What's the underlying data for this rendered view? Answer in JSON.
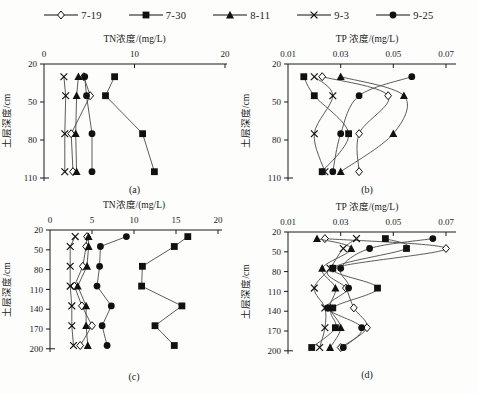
{
  "colors": {
    "axis": "#1a1a1a",
    "line": "#4a4a4a",
    "marker": "#111111",
    "background": "#fdfdfc"
  },
  "legend": {
    "items": [
      {
        "label": "7-19",
        "marker": "open-diamond"
      },
      {
        "label": "7-30",
        "marker": "filled-square"
      },
      {
        "label": "8-11",
        "marker": "filled-triangle"
      },
      {
        "label": "9-3",
        "marker": "cross"
      },
      {
        "label": "9-25",
        "marker": "filled-circle"
      }
    ]
  },
  "chart_data": [
    {
      "id": "a",
      "type": "line",
      "caption": "(a)",
      "title": "TN浓度/(mg/L)",
      "ylabel": "土层深度/cm",
      "xlim": [
        0,
        20
      ],
      "x_ticks": [
        0,
        10,
        20
      ],
      "x_tick_labels": [
        "0",
        "10",
        "20"
      ],
      "ylim": [
        20,
        110
      ],
      "y_ticks": [
        20,
        50,
        80,
        110
      ],
      "smooth": false,
      "depths": [
        30,
        45,
        75,
        105
      ],
      "series": [
        {
          "name": "7-19",
          "marker": "open-diamond",
          "values": [
            4.4,
            5.1,
            3.0,
            3.2
          ]
        },
        {
          "name": "7-30",
          "marker": "filled-square",
          "values": [
            7.8,
            6.8,
            10.9,
            12.2
          ]
        },
        {
          "name": "8-11",
          "marker": "filled-triangle",
          "values": [
            3.8,
            3.6,
            3.5,
            3.6
          ]
        },
        {
          "name": "9-3",
          "marker": "cross",
          "values": [
            2.2,
            2.4,
            2.3,
            2.3
          ]
        },
        {
          "name": "9-25",
          "marker": "filled-circle",
          "values": [
            4.5,
            4.7,
            5.3,
            5.3
          ]
        }
      ]
    },
    {
      "id": "b",
      "type": "line",
      "caption": "(b)",
      "title": "TP 浓度/(mg/L)",
      "ylabel": "土层深度/cm",
      "xlim": [
        0.01,
        0.07
      ],
      "x_ticks": [
        0.01,
        0.03,
        0.05,
        0.07
      ],
      "x_tick_labels": [
        "0.01",
        "0.03",
        "0.05",
        "0.07"
      ],
      "ylim": [
        20,
        110
      ],
      "y_ticks": [
        20,
        50,
        80,
        110
      ],
      "smooth": true,
      "depths": [
        30,
        45,
        75,
        105
      ],
      "series": [
        {
          "name": "7-19",
          "marker": "open-diamond",
          "values": [
            0.023,
            0.048,
            0.037,
            0.037
          ]
        },
        {
          "name": "7-30",
          "marker": "filled-square",
          "values": [
            0.016,
            0.02,
            0.033,
            0.023
          ]
        },
        {
          "name": "8-11",
          "marker": "filled-triangle",
          "values": [
            0.03,
            0.054,
            0.05,
            0.03
          ]
        },
        {
          "name": "9-3",
          "marker": "cross",
          "values": [
            0.02,
            0.027,
            0.02,
            0.024
          ]
        },
        {
          "name": "9-25",
          "marker": "filled-circle",
          "values": [
            0.057,
            0.037,
            0.03,
            0.027
          ]
        }
      ]
    },
    {
      "id": "c",
      "type": "line",
      "caption": "(c)",
      "title": "TN浓度/(mg/L)",
      "ylabel": "土层深度/cm",
      "xlim": [
        0,
        20
      ],
      "x_ticks": [
        0,
        5,
        10,
        15,
        20
      ],
      "x_tick_labels": [
        "0",
        "5",
        "10",
        "15",
        "20"
      ],
      "ylim": [
        20,
        200
      ],
      "y_ticks": [
        20,
        50,
        80,
        110,
        140,
        170,
        200
      ],
      "smooth": false,
      "depths": [
        30,
        45,
        75,
        105,
        135,
        165,
        195
      ],
      "series": [
        {
          "name": "7-19",
          "marker": "open-diamond",
          "values": [
            4.4,
            4.3,
            3.9,
            2.9,
            3.8,
            5.0,
            3.6
          ]
        },
        {
          "name": "7-30",
          "marker": "filled-square",
          "values": [
            16.4,
            14.8,
            11.0,
            10.9,
            15.7,
            12.5,
            14.8
          ]
        },
        {
          "name": "8-11",
          "marker": "filled-triangle",
          "values": [
            4.6,
            4.6,
            4.4,
            3.3,
            4.3,
            4.3,
            4.5
          ]
        },
        {
          "name": "9-3",
          "marker": "cross",
          "values": [
            3.0,
            2.4,
            2.4,
            2.4,
            2.6,
            2.6,
            2.8
          ]
        },
        {
          "name": "9-25",
          "marker": "filled-circle",
          "values": [
            9.1,
            6.0,
            5.9,
            5.6,
            7.3,
            6.2,
            6.8
          ]
        }
      ]
    },
    {
      "id": "d",
      "type": "line",
      "caption": "(d)",
      "title": "TP 浓度/(mg/L)",
      "ylabel": "土层深度/cm",
      "xlim": [
        0.01,
        0.07
      ],
      "x_ticks": [
        0.01,
        0.03,
        0.05,
        0.07
      ],
      "x_tick_labels": [
        "0.01",
        "0.03",
        "0.05",
        "0.07"
      ],
      "ylim": [
        20,
        200
      ],
      "y_ticks": [
        20,
        50,
        80,
        110,
        140,
        170,
        200
      ],
      "smooth": true,
      "depths": [
        30,
        45,
        75,
        105,
        135,
        165,
        195
      ],
      "series": [
        {
          "name": "7-19",
          "marker": "open-diamond",
          "values": [
            0.024,
            0.07,
            0.027,
            0.032,
            0.035,
            0.04,
            0.03
          ]
        },
        {
          "name": "7-30",
          "marker": "filled-square",
          "values": [
            0.047,
            0.055,
            0.027,
            0.044,
            0.027,
            0.028,
            0.019
          ]
        },
        {
          "name": "8-11",
          "marker": "filled-triangle",
          "values": [
            0.021,
            0.034,
            0.023,
            0.028,
            0.026,
            0.03,
            0.026
          ]
        },
        {
          "name": "9-3",
          "marker": "cross",
          "values": [
            0.036,
            0.031,
            0.026,
            0.02,
            0.024,
            0.024,
            0.022
          ]
        },
        {
          "name": "9-25",
          "marker": "filled-circle",
          "values": [
            0.065,
            0.041,
            0.03,
            0.033,
            0.025,
            0.038,
            0.031
          ]
        }
      ]
    }
  ]
}
